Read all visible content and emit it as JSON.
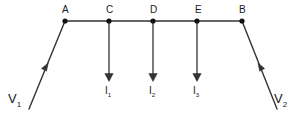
{
  "diagram": {
    "style": {
      "line_color": "#333333",
      "node_color": "#111111",
      "text_color": "#1a1a1a",
      "background": "#ffffff",
      "line_width": 1.4
    },
    "nodes": [
      {
        "id": "A",
        "label": "A",
        "x": 65,
        "y": 21,
        "label_x": 62,
        "label_y": 5
      },
      {
        "id": "C",
        "label": "C",
        "x": 109,
        "y": 21,
        "label_x": 106,
        "label_y": 5
      },
      {
        "id": "D",
        "label": "D",
        "x": 153,
        "y": 21,
        "label_x": 150,
        "label_y": 5
      },
      {
        "id": "E",
        "label": "E",
        "x": 197,
        "y": 21,
        "label_x": 195,
        "label_y": 5
      },
      {
        "id": "B",
        "label": "B",
        "x": 242,
        "y": 21,
        "label_x": 239,
        "label_y": 5
      }
    ],
    "bus": {
      "from_x": 65,
      "to_x": 242,
      "y": 21
    },
    "current_branches": [
      {
        "label": "I",
        "subscript": "1",
        "x": 109,
        "from_y": 21,
        "to_y": 81,
        "label_x": 104,
        "label_y": 86
      },
      {
        "label": "I",
        "subscript": "2",
        "x": 153,
        "from_y": 21,
        "to_y": 81,
        "label_x": 148,
        "label_y": 86
      },
      {
        "label": "I",
        "subscript": "3",
        "x": 197,
        "from_y": 21,
        "to_y": 81,
        "label_x": 192,
        "label_y": 86
      }
    ],
    "sources": [
      {
        "id": "V1",
        "label": "V",
        "subscript": "1",
        "from_x": 29,
        "from_y": 109,
        "to_x": 65,
        "to_y": 21,
        "arrow_x": 46,
        "arrow_y": 66,
        "label_x": 8,
        "label_y": 92
      },
      {
        "id": "V2",
        "label": "V",
        "subscript": "2",
        "from_x": 277,
        "from_y": 109,
        "to_x": 242,
        "to_y": 21,
        "arrow_x": 260,
        "arrow_y": 66,
        "label_x": 274,
        "label_y": 92
      }
    ]
  }
}
